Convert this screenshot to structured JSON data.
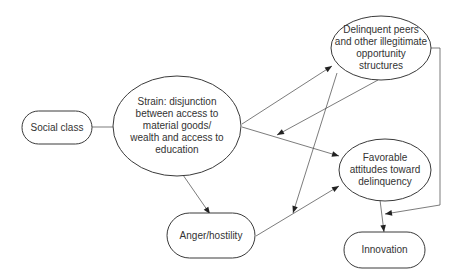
{
  "diagram": {
    "type": "flowchart",
    "nodes": {
      "social_class": {
        "label": "Social class"
      },
      "strain": {
        "lines": [
          "Strain: disjunction",
          "between access to",
          "material goods/",
          "wealth and access to",
          "education"
        ]
      },
      "delinquent_peers": {
        "lines": [
          "Delinquent peers",
          "and other illegitimate",
          "opportunity",
          "structures"
        ]
      },
      "favorable_attitudes": {
        "lines": [
          "Favorable",
          "attitudes toward",
          "delinquency"
        ]
      },
      "anger": {
        "label": "Anger/hostility"
      },
      "innovation": {
        "label": "Innovation"
      }
    },
    "edges": [
      {
        "from": "Social class",
        "to": "Strain"
      },
      {
        "from": "Strain",
        "to": "Delinquent peers and other illegitimate opportunity structures"
      },
      {
        "from": "Delinquent peers and other illegitimate opportunity structures",
        "to": "Strain"
      },
      {
        "from": "Strain",
        "to": "Favorable attitudes toward delinquency"
      },
      {
        "from": "Strain",
        "to": "Anger/hostility"
      },
      {
        "from": "Delinquent peers and other illegitimate opportunity structures",
        "to": "Anger/hostility"
      },
      {
        "from": "Anger/hostility",
        "to": "Favorable attitudes toward delinquency"
      },
      {
        "from": "Favorable attitudes toward delinquency",
        "to": "Innovation"
      },
      {
        "from": "Delinquent peers and other illegitimate opportunity structures",
        "to": "Innovation"
      }
    ]
  }
}
